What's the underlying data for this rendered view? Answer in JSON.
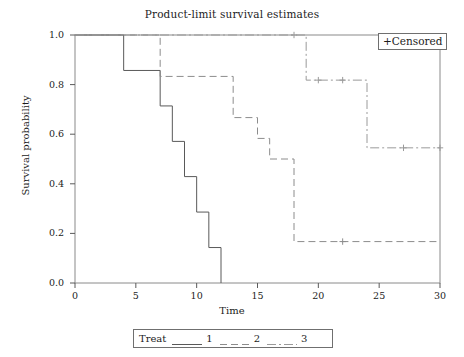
{
  "chart_data": {
    "type": "line",
    "title": "Product-limit survival estimates",
    "xlabel": "Time",
    "ylabel": "Survival probability",
    "xlim": [
      0,
      30
    ],
    "ylim": [
      0.0,
      1.0
    ],
    "xticks": [
      0,
      5,
      10,
      15,
      20,
      25,
      30
    ],
    "yticks": [
      "0.0",
      "0.2",
      "0.4",
      "0.6",
      "0.8",
      "1.0"
    ],
    "grid": false,
    "step_type": "post",
    "legend_position": "below-axes",
    "legend_title": "Treat",
    "censored_note": "+Censored",
    "censored_marker": "+",
    "series": [
      {
        "name": "1",
        "label": "1",
        "linestyle": "solid",
        "color": "#595959",
        "x": [
          0,
          4,
          7,
          8,
          9,
          10,
          11,
          12
        ],
        "y": [
          1.0,
          0.857,
          0.714,
          0.571,
          0.429,
          0.286,
          0.143,
          0.0
        ],
        "censored_x": [],
        "censored_y": []
      },
      {
        "name": "2",
        "label": "2",
        "linestyle": "dashed",
        "color": "#8c8c8c",
        "x": [
          0,
          7,
          13,
          15,
          16,
          18,
          22
        ],
        "y": [
          1.0,
          0.833,
          0.667,
          0.583,
          0.5,
          0.167,
          0.167
        ],
        "censored_x": [
          22
        ],
        "censored_y": [
          0.167
        ]
      },
      {
        "name": "3",
        "label": "3",
        "linestyle": "dashdot",
        "color": "#9a9a9a",
        "x": [
          0,
          19,
          24,
          30
        ],
        "y": [
          1.0,
          0.818,
          0.545,
          0.545
        ],
        "censored_x": [
          18,
          20,
          22,
          27,
          30
        ],
        "censored_y": [
          1.0,
          0.818,
          0.818,
          0.545,
          0.545
        ]
      }
    ]
  },
  "figure": {
    "title": "Product-limit survival estimates",
    "xlabel": "Time",
    "ylabel": "Survival probability",
    "censored_label": "+Censored",
    "legend_title": "Treat",
    "legend_keys": [
      "1",
      "2",
      "3"
    ],
    "xtick_labels": [
      "0",
      "5",
      "10",
      "15",
      "20",
      "25",
      "30"
    ],
    "ytick_labels": [
      "0.0",
      "0.2",
      "0.4",
      "0.6",
      "0.8",
      "1.0"
    ]
  }
}
